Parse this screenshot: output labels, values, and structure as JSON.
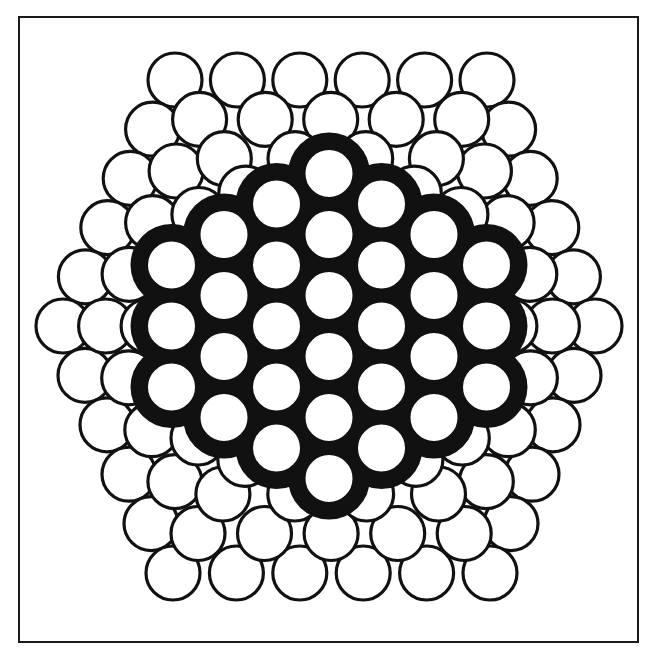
{
  "figure": {
    "canvas": {
      "width": 656,
      "height": 658,
      "background": "#ffffff"
    },
    "frame": {
      "x": 19,
      "y": 17,
      "width": 619,
      "height": 625,
      "stroke": "#1a1a1a",
      "stroke_width": 2
    },
    "colors": {
      "atom_fill": "#ffffff",
      "atom_stroke": "#111111",
      "face_backing": "#111111"
    },
    "center": [
      329,
      326
    ],
    "atom_radius": 27,
    "atom_stroke_width": 3.2,
    "shells": [
      {
        "name": "outer-shell",
        "scale": 1.0,
        "per_edge": 6
      },
      {
        "name": "shell-2",
        "scale": 0.84,
        "per_edge": 5
      },
      {
        "name": "shell-3",
        "scale": 0.68,
        "per_edge": 4
      },
      {
        "name": "shell-4",
        "scale": 0.54,
        "per_edge": 3
      }
    ],
    "outer_hexagon": [
      [
        175,
        80
      ],
      [
        487,
        80
      ],
      [
        595,
        326
      ],
      [
        490,
        573
      ],
      [
        173,
        573
      ],
      [
        63,
        326
      ]
    ],
    "front_face": {
      "radius": 25,
      "stroke_width": 3,
      "column_pitch": 52.5,
      "row_pitch": 61,
      "columns": [
        {
          "k": -3,
          "count": 3
        },
        {
          "k": -2,
          "count": 4
        },
        {
          "k": -1,
          "count": 5
        },
        {
          "k": 0,
          "count": 6
        },
        {
          "k": 1,
          "count": 5
        },
        {
          "k": 2,
          "count": 4
        },
        {
          "k": 3,
          "count": 3
        }
      ],
      "atom_count": 30
    }
  }
}
